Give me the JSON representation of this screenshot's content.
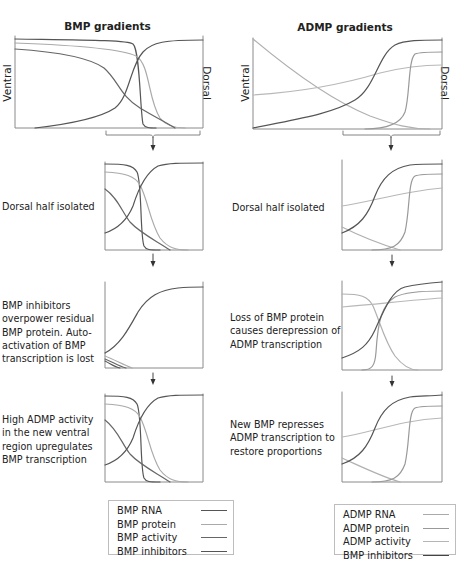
{
  "titles": {
    "bmp": "BMP gradients",
    "admp": "ADMP gradients"
  },
  "axis_labels": {
    "ventral": "Ventral",
    "dorsal": "Dorsal"
  },
  "captions": {
    "bmp": [
      "Dorsal half isolated",
      "BMP inhibitors overpower residual BMP protein. Auto-activation of BMP transcription is lost",
      "High ADMP activity in the new ventral region upregulates BMP transcription"
    ],
    "admp": [
      "Dorsal half isolated",
      "Loss of BMP protein causes derepression of ADMP transcription",
      "New BMP represses ADMP transcription to restore proportions"
    ]
  },
  "legend": {
    "bmp": [
      {
        "label": "BMP RNA",
        "color": "#555555"
      },
      {
        "label": "BMP protein",
        "color": "#aaaaaa"
      },
      {
        "label": "BMP activity",
        "color": "#666666"
      },
      {
        "label": "BMP inhibitors",
        "color": "#555555"
      }
    ],
    "admp": [
      {
        "label": "ADMP RNA",
        "color": "#aaaaaa"
      },
      {
        "label": "ADMP protein",
        "color": "#999999"
      },
      {
        "label": "ADMP activity",
        "color": "#b5b5b5"
      },
      {
        "label": "BMP inhibitors",
        "color": "#444444"
      }
    ]
  },
  "colors": {
    "dark": "#555555",
    "mid": "#999999",
    "light": "#b3b3b3",
    "axis": "#888888"
  },
  "flow": {
    "bmp_steps": [
      "initial gradients",
      "Dorsal half isolated",
      "BMP inhibitors overpower residual BMP protein",
      "High ADMP activity upregulates BMP transcription"
    ],
    "admp_steps": [
      "initial gradients",
      "Dorsal half isolated",
      "Loss of BMP protein causes derepression of ADMP transcription",
      "New BMP represses ADMP transcription"
    ]
  }
}
